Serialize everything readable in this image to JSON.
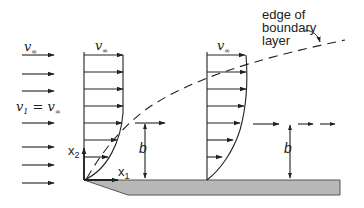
{
  "figure": {
    "labels": {
      "free_stream_top": "v",
      "free_stream_top_sub": "∞",
      "profile1_top": "v",
      "profile1_top_sub": "∞",
      "profile2_top": "v",
      "profile2_top_sub": "∞",
      "inlet_condition_v": "v",
      "inlet_condition_sub1": "1",
      "inlet_condition_eq": " = v",
      "inlet_condition_sub2": "∞",
      "axis_x1": "x",
      "axis_x1_sub": "1",
      "axis_x2": "x",
      "axis_x2_sub": "2",
      "thickness_1": "b",
      "thickness_2": "b",
      "edge_label_line1": "edge of",
      "edge_label_line2": "boundary",
      "edge_label_line3": "layer"
    },
    "colors": {
      "line": "#222222",
      "plate_fill": "#b8b8b8",
      "plate_stroke": "#555555"
    }
  }
}
